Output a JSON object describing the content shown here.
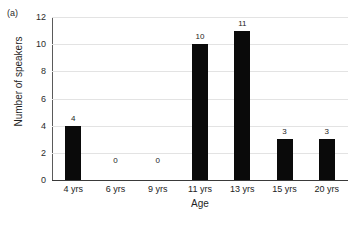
{
  "panel": {
    "label": "(a)"
  },
  "chart_data": {
    "type": "bar",
    "title": "",
    "subtitle": "",
    "xlabel": "Age",
    "ylabel": "Number of speakers",
    "categories": [
      "4 yrs",
      "6 yrs",
      "9 yrs",
      "11 yrs",
      "13 yrs",
      "15 yrs",
      "20 yrs"
    ],
    "values": [
      4,
      0,
      0,
      10,
      11,
      3,
      3
    ],
    "data_labels": [
      "4",
      "0",
      "0",
      "10",
      "11",
      "3",
      "3"
    ],
    "ylim": [
      0,
      12
    ],
    "yticks": [
      0,
      2,
      4,
      6,
      8,
      10,
      12
    ],
    "ytick_labels": [
      "0",
      "2",
      "4",
      "6",
      "8",
      "10",
      "12"
    ],
    "grid": true,
    "grid_axis": "y",
    "legend": false,
    "legend_position": "none",
    "bar_color": "#0a0a0a",
    "grid_color": "#e3e3e3",
    "axis_color": "#3a3a3a"
  }
}
